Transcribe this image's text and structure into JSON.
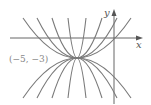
{
  "diagram": {
    "type": "family-of-parabolas",
    "vertex_label": "(−5, −3)",
    "axes": {
      "x_label": "x",
      "y_label": "y"
    },
    "colors": {
      "curves": "#7a7a7a",
      "axes": "#555555",
      "label": "#888888"
    },
    "curves_up_count": 8,
    "curves_down_count": 8
  }
}
